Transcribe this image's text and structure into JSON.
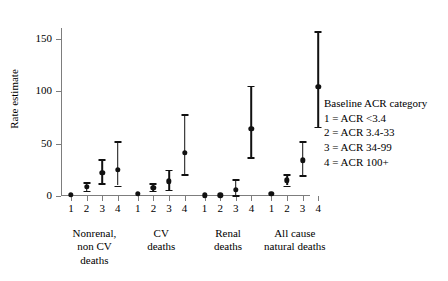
{
  "chart_data": {
    "type": "scatter",
    "title": "",
    "xlabel": "",
    "ylabel": "Rate estimate",
    "ylim": [
      0,
      160
    ],
    "yticks": [
      0,
      50,
      100,
      150
    ],
    "ytick_labels": [
      "0",
      "50",
      "100",
      "150"
    ],
    "grid": false,
    "legend_position": "right",
    "error_bars": "vertical confidence intervals with caps",
    "categories": [
      "Nonrenal, non CV deaths",
      "CV deaths",
      "Renal deaths",
      "All cause natural deaths"
    ],
    "subcategories": [
      "1",
      "2",
      "3",
      "4"
    ],
    "groups": [
      {
        "label_lines": [
          "Nonrenal,",
          "non CV",
          "deaths"
        ],
        "points": [
          {
            "x_label": "1",
            "value": 1,
            "low": 0.3,
            "high": 2
          },
          {
            "x_label": "2",
            "value": 9,
            "low": 5,
            "high": 13
          },
          {
            "x_label": "3",
            "value": 22,
            "low": 12,
            "high": 35
          },
          {
            "x_label": "4",
            "value": 25,
            "low": 10,
            "high": 52
          }
        ]
      },
      {
        "label_lines": [
          "CV",
          "deaths"
        ],
        "points": [
          {
            "x_label": "1",
            "value": 2,
            "low": 1,
            "high": 3
          },
          {
            "x_label": "2",
            "value": 8,
            "low": 5,
            "high": 12
          },
          {
            "x_label": "3",
            "value": 14,
            "low": 6,
            "high": 25
          },
          {
            "x_label": "4",
            "value": 41,
            "low": 21,
            "high": 78
          }
        ]
      },
      {
        "label_lines": [
          "Renal",
          "deaths"
        ],
        "points": [
          {
            "x_label": "1",
            "value": 0.5,
            "low": 0.2,
            "high": 1
          },
          {
            "x_label": "2",
            "value": 0.7,
            "low": 0.3,
            "high": 1.2
          },
          {
            "x_label": "3",
            "value": 6,
            "low": 1,
            "high": 16
          },
          {
            "x_label": "4",
            "value": 64,
            "low": 37,
            "high": 105
          }
        ]
      },
      {
        "label_lines": [
          "All cause",
          "natural deaths"
        ],
        "points": [
          {
            "x_label": "1",
            "value": 2,
            "low": 1,
            "high": 3
          },
          {
            "x_label": "2",
            "value": 15,
            "low": 10,
            "high": 21
          },
          {
            "x_label": "3",
            "value": 34,
            "low": 20,
            "high": 52
          },
          {
            "x_label": "4",
            "value": 104,
            "low": 66,
            "high": 157
          }
        ]
      }
    ]
  },
  "legend": {
    "title": "Baseline ACR category",
    "entries": [
      "1 = ACR <3.4",
      "2 = ACR 3.4-33",
      "3 = ACR 34-99",
      "4 = ACR 100+"
    ]
  },
  "colors": {
    "marker": "#111111",
    "axis": "#7d7d7d",
    "background": "#ffffff"
  }
}
